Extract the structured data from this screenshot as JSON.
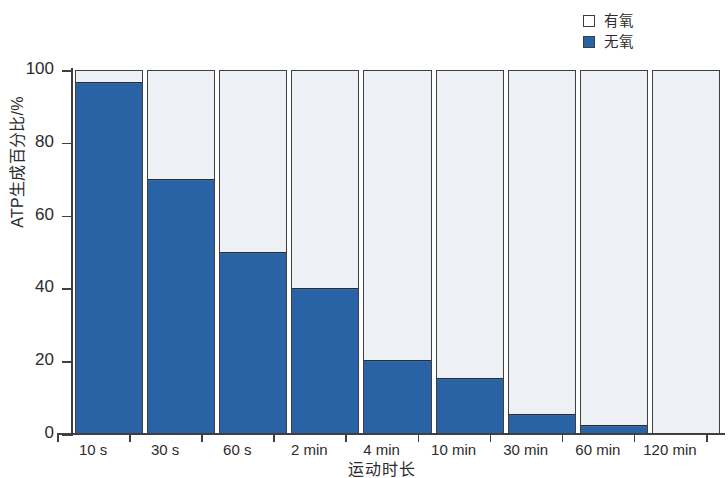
{
  "chart_data": {
    "type": "bar",
    "subtype": "stacked-100-percent",
    "title": "",
    "xlabel": "运动时长",
    "ylabel": "ATP生成百分比/%",
    "categories": [
      "10 s",
      "30 s",
      "60 s",
      "2 min",
      "4 min",
      "10 min",
      "30 min",
      "60 min",
      "120 min"
    ],
    "series": [
      {
        "name": "无氧",
        "color": "#2a62a6",
        "values": [
          97,
          70,
          50,
          40,
          20,
          15,
          5,
          2,
          0
        ]
      },
      {
        "name": "有氧",
        "color": "#edf1f6",
        "values": [
          3,
          30,
          50,
          60,
          80,
          85,
          95,
          98,
          100
        ]
      }
    ],
    "ylim": [
      0,
      100
    ],
    "yticks": [
      0,
      20,
      40,
      60,
      80,
      100
    ],
    "ytick_labels": [
      "0",
      "20",
      "40",
      "60",
      "80",
      "100"
    ],
    "grid": false,
    "legend_position": "top-right"
  },
  "legend": {
    "items": [
      {
        "label": "有氧",
        "swatch": "aerobic"
      },
      {
        "label": "无氧",
        "swatch": "anaerobic"
      }
    ]
  },
  "axes": {
    "y_title": "ATP生成百分比/%",
    "x_title": "运动时长",
    "y_labels": [
      "100",
      "80",
      "60",
      "40",
      "20",
      "0"
    ],
    "x_labels": [
      "10 s",
      "30 s",
      "60 s",
      "2 min",
      "4 min",
      "10 min",
      "30 min",
      "60 min",
      "120 min"
    ]
  },
  "colors": {
    "anaerobic": "#2a62a6",
    "aerobic": "#edf1f6",
    "axis": "#3f3f3f",
    "text": "#2b2b2b",
    "background": "#ffffff"
  }
}
